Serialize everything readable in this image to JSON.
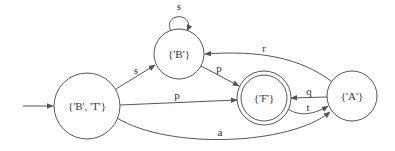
{
  "diagram": {
    "type": "finite-state-automaton",
    "colors": {
      "stroke": "#555555",
      "text": "#333333",
      "background": "#ffffff"
    },
    "nodes": [
      {
        "id": "BT",
        "label": "{'B', 'T'}",
        "initial": true,
        "accepting": false
      },
      {
        "id": "B",
        "label": "{'B'}",
        "initial": false,
        "accepting": false
      },
      {
        "id": "F",
        "label": "{'F'}",
        "initial": false,
        "accepting": true
      },
      {
        "id": "A",
        "label": "{'A'}",
        "initial": false,
        "accepting": false
      }
    ],
    "edges": [
      {
        "from": "B",
        "to": "B",
        "label": "s"
      },
      {
        "from": "BT",
        "to": "B",
        "label": "s"
      },
      {
        "from": "B",
        "to": "F",
        "label": "p"
      },
      {
        "from": "BT",
        "to": "F",
        "label": "p"
      },
      {
        "from": "A",
        "to": "B",
        "label": "r"
      },
      {
        "from": "A",
        "to": "F",
        "label": "q"
      },
      {
        "from": "F",
        "to": "A",
        "label": "t"
      },
      {
        "from": "BT",
        "to": "A",
        "label": "a"
      }
    ]
  }
}
